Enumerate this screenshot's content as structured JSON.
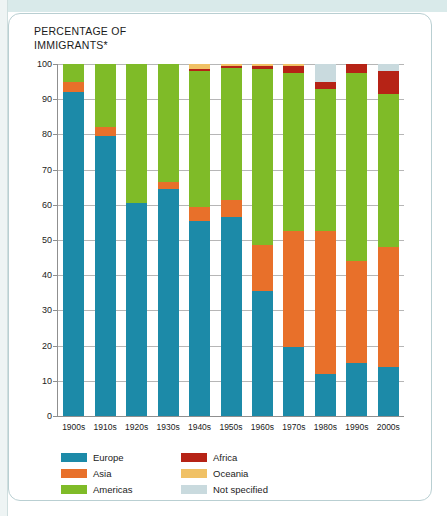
{
  "title": {
    "line1": "PERCENTAGE OF",
    "line2": "IMMIGRANTS*"
  },
  "colors": {
    "europe": "#1c8aa8",
    "asia": "#e8702a",
    "americas": "#7fbb28",
    "africa": "#b62316",
    "oceania": "#f0c165",
    "not_specified": "#c9dade",
    "grid": "#b6b6b6",
    "axis": "#8f8f8f",
    "text": "#1b1b1b",
    "card_border": "#b9cfd2",
    "top_band": "#d9eaea"
  },
  "chart_data": {
    "type": "bar",
    "stacked": true,
    "title": "PERCENTAGE OF IMMIGRANTS*",
    "xlabel": "",
    "ylabel": "PERCENTAGE OF IMMIGRANTS*",
    "ylim": [
      0,
      100
    ],
    "yticks": [
      0,
      10,
      20,
      30,
      40,
      50,
      60,
      70,
      80,
      90,
      100
    ],
    "grid": true,
    "legend_position": "bottom-left",
    "categories": [
      "1900s",
      "1910s",
      "1920s",
      "1930s",
      "1940s",
      "1950s",
      "1960s",
      "1970s",
      "1980s",
      "1990s",
      "2000s"
    ],
    "series": [
      {
        "name": "Europe",
        "color": "#1c8aa8",
        "values": [
          92.0,
          79.5,
          60.5,
          64.5,
          55.5,
          56.5,
          35.5,
          19.5,
          12.0,
          15.0,
          14.0
        ]
      },
      {
        "name": "Asia",
        "color": "#e8702a",
        "values": [
          3.0,
          2.5,
          0.0,
          2.0,
          4.0,
          5.0,
          13.0,
          33.0,
          40.5,
          29.0,
          34.0
        ]
      },
      {
        "name": "Americas",
        "color": "#7fbb28",
        "values": [
          5.0,
          18.0,
          39.5,
          33.5,
          38.5,
          37.3,
          50.0,
          45.0,
          40.5,
          53.5,
          43.5
        ]
      },
      {
        "name": "Africa",
        "color": "#b62316",
        "values": [
          0.0,
          0.0,
          0.0,
          0.0,
          0.7,
          0.6,
          0.9,
          2.0,
          2.0,
          2.5,
          6.5
        ]
      },
      {
        "name": "Oceania",
        "color": "#f0c165",
        "values": [
          0.0,
          0.0,
          0.0,
          0.0,
          1.3,
          0.6,
          0.6,
          0.5,
          0.0,
          0.0,
          0.0
        ]
      },
      {
        "name": "Not specified",
        "color": "#c9dade",
        "values": [
          0.0,
          0.0,
          0.0,
          0.0,
          0.0,
          0.0,
          0.0,
          0.0,
          5.0,
          0.0,
          2.0
        ]
      }
    ]
  },
  "legend": {
    "items": [
      {
        "label": "Europe",
        "color": "#1c8aa8"
      },
      {
        "label": "Africa",
        "color": "#b62316"
      },
      {
        "label": "Asia",
        "color": "#e8702a"
      },
      {
        "label": "Oceania",
        "color": "#f0c165"
      },
      {
        "label": "Americas",
        "color": "#7fbb28"
      },
      {
        "label": "Not specified",
        "color": "#c9dade"
      }
    ]
  }
}
